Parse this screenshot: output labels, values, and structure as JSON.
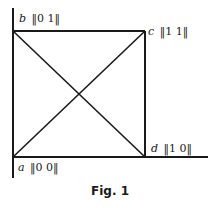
{
  "figure": {
    "caption": "Fig. 1",
    "colors": {
      "line": "#1a1a1a",
      "background": "#ffffff"
    },
    "vertices": [
      {
        "id": "a",
        "label": "a",
        "vector": "‖0   0‖",
        "coords": [
          0,
          0
        ]
      },
      {
        "id": "b",
        "label": "b",
        "vector": "‖0   1‖",
        "coords": [
          0,
          1
        ]
      },
      {
        "id": "c",
        "label": "c",
        "vector": "‖1   1‖",
        "coords": [
          1,
          1
        ]
      },
      {
        "id": "d",
        "label": "d",
        "vector": "‖1   0‖",
        "coords": [
          1,
          0
        ]
      }
    ],
    "edges": [
      [
        "a",
        "b"
      ],
      [
        "b",
        "c"
      ],
      [
        "c",
        "d"
      ],
      [
        "a",
        "d"
      ],
      [
        "a",
        "c"
      ],
      [
        "b",
        "d"
      ]
    ]
  }
}
